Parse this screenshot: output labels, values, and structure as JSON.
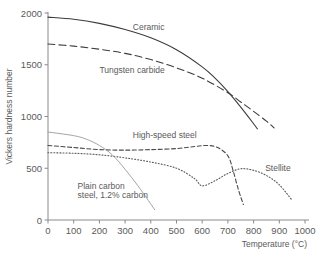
{
  "chart_data": {
    "type": "line",
    "title": "",
    "xlabel": "Temperature (°C)",
    "ylabel": "Vickers hardness number",
    "xlim": [
      0,
      1000
    ],
    "ylim": [
      0,
      2000
    ],
    "xticks": [
      "0",
      "100",
      "200",
      "300",
      "400",
      "500",
      "600",
      "700",
      "800",
      "900",
      "1000"
    ],
    "yticks": [
      "0",
      "500",
      "1000",
      "1500",
      "2000"
    ],
    "grid": false,
    "legend": "inline-curve-labels",
    "series": [
      {
        "name": "Ceramic",
        "style": "solid",
        "color": "#3c3c3c",
        "label_x": 330,
        "label_y": 1840,
        "x": [
          0,
          100,
          200,
          300,
          400,
          500,
          600,
          650,
          700,
          750,
          800,
          815
        ],
        "y": [
          1960,
          1940,
          1900,
          1840,
          1760,
          1645,
          1480,
          1370,
          1240,
          1090,
          930,
          880
        ]
      },
      {
        "name": "Tungsten carbide",
        "style": "dashed",
        "color": "#3c3c3c",
        "label_x": 245,
        "label_y": 1420,
        "x": [
          0,
          100,
          200,
          300,
          400,
          500,
          600,
          700,
          750,
          800,
          850,
          880
        ],
        "y": [
          1700,
          1680,
          1650,
          1610,
          1550,
          1470,
          1370,
          1230,
          1140,
          1050,
          955,
          890
        ]
      },
      {
        "name": "High-speed steel",
        "style": "dashed-fine",
        "color": "#4a4a4a",
        "label_x": 400,
        "label_y": 790,
        "x": [
          0,
          100,
          200,
          300,
          400,
          500,
          570,
          620,
          660,
          700,
          720,
          740,
          760
        ],
        "y": [
          720,
          700,
          680,
          675,
          680,
          690,
          710,
          720,
          700,
          620,
          480,
          300,
          150
        ]
      },
      {
        "name": "Stellite",
        "style": "dotted",
        "color": "#5a5a5a",
        "label_x": 870,
        "label_y": 490,
        "x": [
          0,
          100,
          200,
          300,
          400,
          500,
          570,
          600,
          650,
          700,
          750,
          800,
          850,
          900,
          950
        ],
        "y": [
          650,
          645,
          630,
          600,
          560,
          500,
          400,
          330,
          380,
          450,
          495,
          480,
          430,
          340,
          190
        ]
      },
      {
        "name": "Plain carbon steel, 1.2% carbon",
        "style": "solid-light",
        "color": "#9a9a9a",
        "label_x": 130,
        "label_y": 285,
        "label_line2_y": 205,
        "x": [
          0,
          100,
          150,
          200,
          250,
          300,
          350,
          390,
          415
        ],
        "y": [
          850,
          815,
          780,
          720,
          630,
          490,
          330,
          190,
          100
        ]
      }
    ],
    "series_labels": {
      "ceramic": "Ceramic",
      "tungsten_carbide": "Tungsten carbide",
      "high_speed_steel": "High-speed steel",
      "stellite": "Stellite",
      "plain_carbon_line1": "Plain carbon",
      "plain_carbon_line2": "steel, 1.2% carbon"
    }
  }
}
